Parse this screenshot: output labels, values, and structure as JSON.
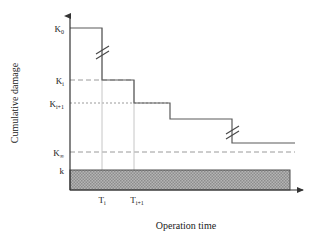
{
  "figure": {
    "type": "step-decay-diagram",
    "axes": {
      "x_title": "Operation time",
      "y_title": "Cumulative damage",
      "x_origin_px": 70,
      "y_origin_px": 190,
      "x_arrow_end_px": 307,
      "y_arrow_top_px": 12
    },
    "y_ticks": [
      {
        "id": "K0",
        "base": "K",
        "sub": "0",
        "y_px": 28,
        "gridline": "none"
      },
      {
        "id": "Ki",
        "base": "K",
        "sub": "i",
        "y_px": 80,
        "gridline": "dashed"
      },
      {
        "id": "Ki1",
        "base": "K",
        "sub": "i+1",
        "y_px": 103,
        "gridline": "dotted"
      },
      {
        "id": "Kinf",
        "base": "K",
        "sub": "∞",
        "y_px": 152,
        "gridline": "dashed"
      },
      {
        "id": "k",
        "base": "k",
        "sub": "",
        "y_px": 170,
        "gridline": "none"
      }
    ],
    "x_ticks": [
      {
        "id": "Ti",
        "base": "T",
        "sub": "i",
        "x_px": 102
      },
      {
        "id": "Ti1",
        "base": "T",
        "sub": "i+1",
        "x_px": 134
      }
    ],
    "step_curve": {
      "description": "Monotonically decreasing staircase of cumulative damage with two axis-break marks",
      "points_px": [
        {
          "x": 70,
          "y": 28
        },
        {
          "x": 102,
          "y": 28
        },
        {
          "x": 102,
          "y": 80
        },
        {
          "x": 134,
          "y": 80
        },
        {
          "x": 134,
          "y": 103
        },
        {
          "x": 170,
          "y": 103
        },
        {
          "x": 170,
          "y": 119
        },
        {
          "x": 232,
          "y": 119
        },
        {
          "x": 232,
          "y": 143
        },
        {
          "x": 295,
          "y": 143
        }
      ]
    },
    "break_marks": [
      {
        "id": "break-upper",
        "x_px": 102,
        "y_px": 52
      },
      {
        "id": "break-lower",
        "x_px": 232,
        "y_px": 131
      }
    ],
    "drop_lines_px": [
      102,
      134
    ],
    "shaded_band": {
      "label_ref": "k",
      "x_start_px": 70,
      "x_end_px": 290,
      "y_top_px": 170,
      "y_bottom_px": 190,
      "fill": "#a8a8a8",
      "pattern": "stipple"
    },
    "colors": {
      "curve": "#4a4a4a",
      "axis": "#333333",
      "gridline": "#9a9a9a",
      "dropline": "#c0c0c0",
      "band_fill": "#a9a9a9",
      "band_stroke": "#555555"
    }
  }
}
